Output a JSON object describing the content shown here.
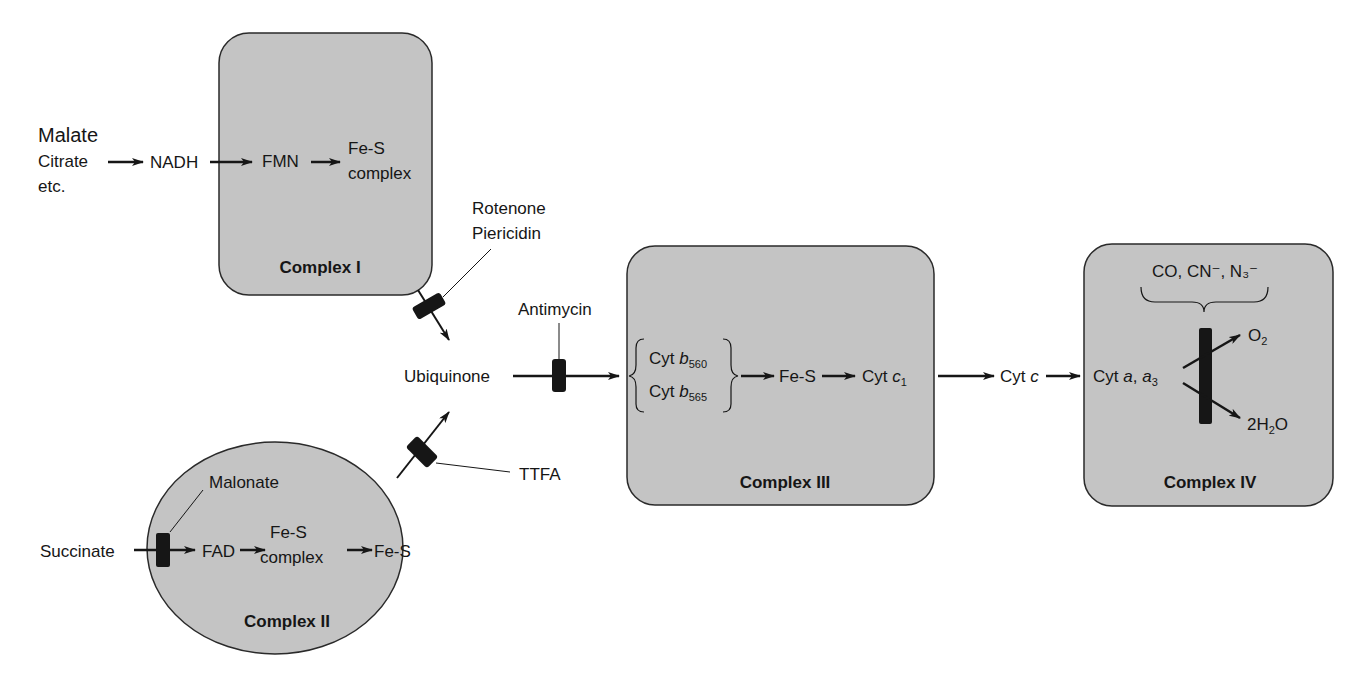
{
  "diagram": {
    "fill_color": "#c4c4c4",
    "stroke_color": "#2a2a2a",
    "inputs": {
      "malate_group": [
        "Malate",
        "Citrate",
        "etc."
      ],
      "nadh": "NADH",
      "succinate": "Succinate"
    },
    "complex_1": {
      "label": "Complex I",
      "fmn": "FMN",
      "fes_line1": "Fe-S",
      "fes_line2": "complex"
    },
    "complex_2": {
      "label": "Complex II",
      "fad": "FAD",
      "fes_complex_line1": "Fe-S",
      "fes_complex_line2": "complex",
      "fes": "Fe-S",
      "inhibitor": "Malonate"
    },
    "ubiquinone": "Ubiquinone",
    "inhibitors": {
      "complex_1_line1": "Rotenone",
      "complex_1_line2": "Piericidin",
      "ubiquinone_to_3": "Antimycin",
      "complex_2_to_q": "TTFA",
      "complex_4": "CO, CN⁻, N₃⁻"
    },
    "complex_3": {
      "label": "Complex III",
      "cyt_b560_prefix": "Cyt ",
      "cyt_b560_italic": "b",
      "cyt_b560_sub": "560",
      "cyt_b565_prefix": "Cyt ",
      "cyt_b565_italic": "b",
      "cyt_b565_sub": "565",
      "fes": "Fe-S",
      "cyt_c1_prefix": "Cyt ",
      "cyt_c1_italic": "c",
      "cyt_c1_sub": "1"
    },
    "cyt_c": {
      "prefix": "Cyt ",
      "italic": "c"
    },
    "complex_4": {
      "label": "Complex IV",
      "cyt_a_prefix": "Cyt ",
      "cyt_a_italic1": "a",
      "cyt_a_sep": ", ",
      "cyt_a_italic2": "a",
      "cyt_a_sub": "3",
      "o2_main": "O",
      "o2_sub": "2",
      "water_pre": "2H",
      "water_sub": "2",
      "water_post": "O"
    }
  }
}
